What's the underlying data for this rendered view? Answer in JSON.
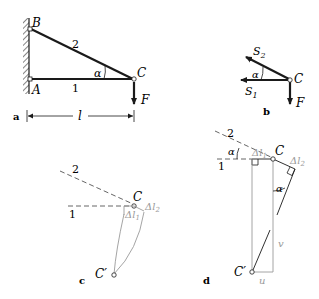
{
  "panels": {
    "a": {
      "label": "a",
      "points": {
        "A": "A",
        "B": "B",
        "C": "C"
      },
      "bars": {
        "bar1": "1",
        "bar2": "2"
      },
      "angle": "α",
      "force": "F",
      "length": "l"
    },
    "b": {
      "label": "b",
      "point": "C",
      "forces": {
        "S1": "S",
        "S1_sub": "1",
        "S2": "S",
        "S2_sub": "2",
        "F": "F"
      },
      "angle": "α"
    },
    "c": {
      "label": "c",
      "bar1": "1",
      "bar2": "2",
      "point_C": "C",
      "point_C_prime": "C′",
      "dl1": "Δl",
      "dl1_sub": "1",
      "dl2": "Δl",
      "dl2_sub": "2"
    },
    "d": {
      "label": "d",
      "bar1": "1",
      "bar2": "2",
      "angle1": "α",
      "angle2": "α",
      "point_C": "C",
      "point_C_prime": "C′",
      "dl1": "Δl",
      "dl1_sub": "1",
      "dl2": "Δl",
      "dl2_sub": "2",
      "v": "v",
      "u": "u"
    }
  },
  "colors": {
    "stroke": "#1a1a1a",
    "gray": "#9a9a9a"
  }
}
